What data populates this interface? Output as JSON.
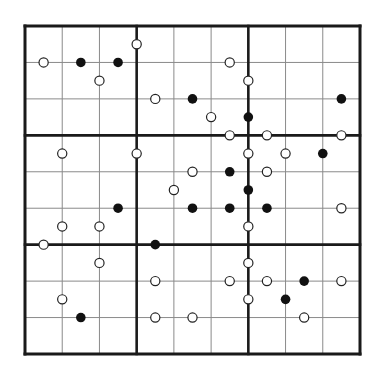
{
  "puzzle": {
    "cols": 9,
    "rows": 9,
    "box_size": 3,
    "grid": {
      "x0": 25,
      "y0": 26,
      "x1": 360,
      "y1": 354
    },
    "colors": {
      "thin_line": "#8a8a8a",
      "thick_line": "#1a1a1a",
      "black_dot": "#111111",
      "white_dot_fill": "#ffffff",
      "white_dot_stroke": "#222222"
    },
    "circles": [
      {
        "c": 3,
        "r": 0.5,
        "t": "white"
      },
      {
        "c": 0.5,
        "r": 1,
        "t": "white"
      },
      {
        "c": 1.5,
        "r": 1,
        "t": "black"
      },
      {
        "c": 2.5,
        "r": 1,
        "t": "black"
      },
      {
        "c": 5.5,
        "r": 1,
        "t": "white"
      },
      {
        "c": 2,
        "r": 1.5,
        "t": "white"
      },
      {
        "c": 6,
        "r": 1.5,
        "t": "white"
      },
      {
        "c": 3.5,
        "r": 2,
        "t": "white"
      },
      {
        "c": 4.5,
        "r": 2,
        "t": "black"
      },
      {
        "c": 8.5,
        "r": 2,
        "t": "black"
      },
      {
        "c": 5,
        "r": 2.5,
        "t": "white"
      },
      {
        "c": 6,
        "r": 2.5,
        "t": "black"
      },
      {
        "c": 5.5,
        "r": 3,
        "t": "white"
      },
      {
        "c": 6.5,
        "r": 3,
        "t": "white"
      },
      {
        "c": 8.5,
        "r": 3,
        "t": "white"
      },
      {
        "c": 1,
        "r": 3.5,
        "t": "white"
      },
      {
        "c": 3,
        "r": 3.5,
        "t": "white"
      },
      {
        "c": 6,
        "r": 3.5,
        "t": "white"
      },
      {
        "c": 7,
        "r": 3.5,
        "t": "white"
      },
      {
        "c": 8,
        "r": 3.5,
        "t": "black"
      },
      {
        "c": 4.5,
        "r": 4,
        "t": "white"
      },
      {
        "c": 5.5,
        "r": 4,
        "t": "black"
      },
      {
        "c": 6.5,
        "r": 4,
        "t": "white"
      },
      {
        "c": 4,
        "r": 4.5,
        "t": "white"
      },
      {
        "c": 6,
        "r": 4.5,
        "t": "black"
      },
      {
        "c": 2.5,
        "r": 5,
        "t": "black"
      },
      {
        "c": 4.5,
        "r": 5,
        "t": "black"
      },
      {
        "c": 5.5,
        "r": 5,
        "t": "black"
      },
      {
        "c": 6.5,
        "r": 5,
        "t": "black"
      },
      {
        "c": 8.5,
        "r": 5,
        "t": "white"
      },
      {
        "c": 1,
        "r": 5.5,
        "t": "white"
      },
      {
        "c": 2,
        "r": 5.5,
        "t": "white"
      },
      {
        "c": 6,
        "r": 5.5,
        "t": "white"
      },
      {
        "c": 0.5,
        "r": 6,
        "t": "white"
      },
      {
        "c": 3.5,
        "r": 6,
        "t": "black"
      },
      {
        "c": 2,
        "r": 6.5,
        "t": "white"
      },
      {
        "c": 6,
        "r": 6.5,
        "t": "white"
      },
      {
        "c": 3.5,
        "r": 7,
        "t": "white"
      },
      {
        "c": 5.5,
        "r": 7,
        "t": "white"
      },
      {
        "c": 6.5,
        "r": 7,
        "t": "white"
      },
      {
        "c": 7.5,
        "r": 7,
        "t": "black"
      },
      {
        "c": 8.5,
        "r": 7,
        "t": "white"
      },
      {
        "c": 1,
        "r": 7.5,
        "t": "white"
      },
      {
        "c": 6,
        "r": 7.5,
        "t": "white"
      },
      {
        "c": 7,
        "r": 7.5,
        "t": "black"
      },
      {
        "c": 1.5,
        "r": 8,
        "t": "black"
      },
      {
        "c": 3.5,
        "r": 8,
        "t": "white"
      },
      {
        "c": 4.5,
        "r": 8,
        "t": "white"
      },
      {
        "c": 7.5,
        "r": 8,
        "t": "white"
      }
    ]
  }
}
